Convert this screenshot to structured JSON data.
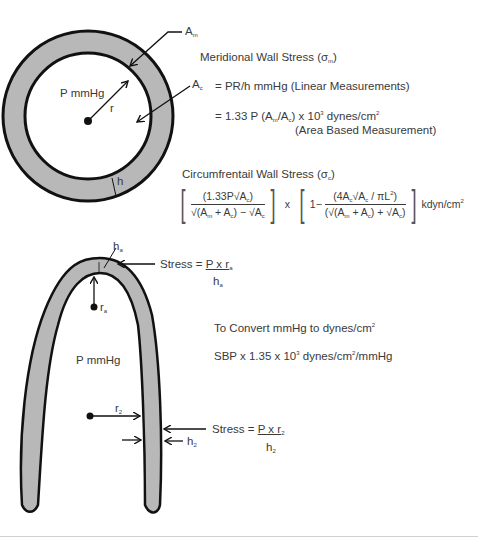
{
  "diagram": {
    "colors": {
      "wall_fill": "#b8b8b8",
      "outline": "#111111",
      "text": "#3a3a3a"
    },
    "circle_view": {
      "label_pressure": "P mmHg",
      "label_radius": "r",
      "label_thickness": "h",
      "label_area_myocardium": "A",
      "label_area_myocardium_sub": "m",
      "label_area_cavity": "A",
      "label_area_cavity_sub": "c"
    },
    "meridional": {
      "title": "Meridional Wall Stress (σ",
      "title_sub": "m",
      "title_end": ")",
      "line1": "= PR/h mmHg (Linear Measurements)",
      "line2_pre": "= 1.33 P (A",
      "line2_sub1": "m",
      "line2_mid": "/A",
      "line2_sub2": "c",
      "line2_post": ") x 10",
      "line2_exp": "3",
      "line2_unit": " dynes/cm",
      "line2_unit_exp": "2",
      "line3": "(Area Based Measurement)"
    },
    "circumferential": {
      "title": "Circumfrentail Wall Stress (σ",
      "title_sub": "c",
      "title_end": ")",
      "frac1_num": "(1.33P√A",
      "frac1_num_sub": "c",
      "frac1_num_end": ")",
      "frac1_den": "√(A",
      "frac1_den_sub1": "m",
      "frac1_den_mid": " + A",
      "frac1_den_sub2": "c",
      "frac1_den_end": ") − √A",
      "frac1_den_sub3": "c",
      "times": "x",
      "one_minus": "1−",
      "frac2_num": "(4A",
      "frac2_num_sub1": "c",
      "frac2_num_mid": "√A",
      "frac2_num_sub2": "c",
      "frac2_num_end": " / πL",
      "frac2_num_exp": "2",
      "frac2_num_close": ")",
      "frac2_den": "(√(A",
      "frac2_den_sub1": "m",
      "frac2_den_mid": " + A",
      "frac2_den_sub2": "c",
      "frac2_den_end": ") + √A",
      "frac2_den_sub3": "c",
      "frac2_den_close": ")",
      "unit": "kdyn/cm",
      "unit_exp": "2"
    },
    "long_axis_view": {
      "label_pressure": "P mmHg",
      "apex_radius": "r",
      "apex_radius_sub": "a",
      "apex_thickness": "h",
      "apex_thickness_sub": "a",
      "apex_stress_pre": "Stress = ",
      "apex_stress_num": "P x r",
      "apex_stress_num_sub": "a",
      "apex_stress_den": "h",
      "apex_stress_den_sub": "a",
      "mid_radius": "r",
      "mid_radius_sub": "2",
      "mid_thickness": "h",
      "mid_thickness_sub": "2",
      "mid_stress_pre": "Stress = ",
      "mid_stress_num": "P x r",
      "mid_stress_num_sub": "2",
      "mid_stress_den": "h",
      "mid_stress_den_sub": "2"
    },
    "conversion": {
      "title": "To Convert mmHg to dynes/cm",
      "title_exp": "2",
      "line_pre": "SBP x 1.35 x 10",
      "line_exp": "3",
      "line_unit": " dynes/cm",
      "line_unit_exp": "2",
      "line_end": "/mmHg"
    }
  }
}
